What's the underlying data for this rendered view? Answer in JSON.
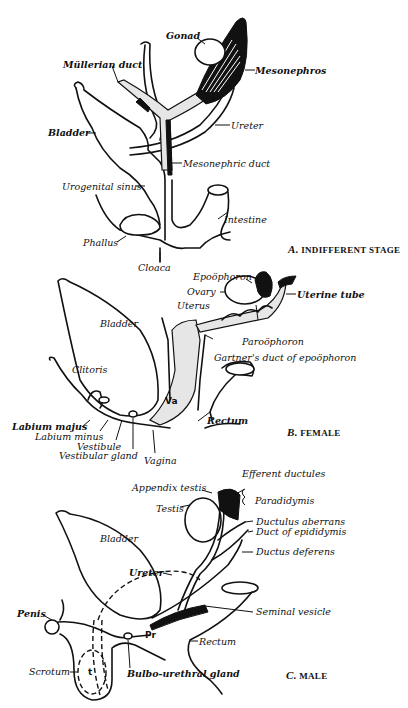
{
  "figure": {
    "panels": [
      {
        "id": "A",
        "caption_letter": "A.",
        "caption_text": "INDIFFERENT STAGE",
        "labels": [
          "Gonad",
          "Müllerian duct",
          "Mesonephros",
          "Bladder",
          "Ureter",
          "Mesonephric duct",
          "Urogenital sinus",
          "Intestine",
          "Phallus",
          "Cloaca"
        ]
      },
      {
        "id": "B",
        "caption_letter": "B.",
        "caption_text": "FEMALE",
        "labels": [
          "Epoöphoron",
          "Ovary",
          "Uterine tube",
          "Uterus",
          "Bladder",
          "Paroöphoron",
          "Gartner's duct of epoöphoron",
          "Clitoris",
          "Rectum",
          "Labium majus",
          "Labium minus",
          "Vestibule",
          "Vestibular gland",
          "Vagina"
        ],
        "inner_labels": [
          "Va"
        ]
      },
      {
        "id": "C",
        "caption_letter": "C.",
        "caption_text": "MALE",
        "labels": [
          "Efferent ductules",
          "Appendix testis",
          "Paradidymis",
          "Testis",
          "Ductulus aberrans",
          "Duct of epididymis",
          "Bladder",
          "Ductus deferens",
          "Ureter",
          "Seminal vesicle",
          "Penis",
          "Rectum",
          "Scrotum",
          "Bulbo-urethral gland"
        ],
        "inner_labels": [
          "Pr",
          "t"
        ]
      }
    ]
  }
}
